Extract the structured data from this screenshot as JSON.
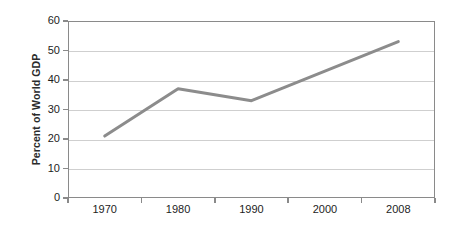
{
  "chart_data": {
    "type": "line",
    "title": "",
    "subtitle": "",
    "xlabel": "",
    "ylabel": "Percent of World GDP",
    "categories": [
      "1970",
      "1980",
      "1990",
      "2000",
      "2008"
    ],
    "x": [
      1970,
      1980,
      1990,
      2000,
      2008
    ],
    "values": [
      21,
      37,
      33,
      43,
      53
    ],
    "series": [
      {
        "name": "Percent of World GDP",
        "values": [
          21,
          37,
          33,
          43,
          53
        ],
        "color": "#8c8c8c"
      }
    ],
    "ylim": [
      0,
      60
    ],
    "yticks": [
      0,
      10,
      20,
      30,
      40,
      50,
      60
    ],
    "ytick_labels": [
      "0",
      "10",
      "20",
      "30",
      "40",
      "50",
      "60"
    ],
    "xtick_labels": [
      "1970",
      "1980",
      "1990",
      "2000",
      "2008"
    ],
    "grid": "horizontal",
    "legend": "none",
    "annotations": [],
    "colors": {
      "line": "#8c8c8c",
      "gridline": "#cfcfcf",
      "axis": "#8a8a8a",
      "text": "#1d1d1d",
      "background": "#ffffff"
    }
  }
}
